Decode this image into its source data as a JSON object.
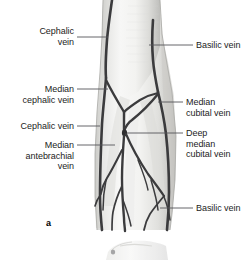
{
  "figure": {
    "letter": "a",
    "letter_x": 46,
    "letter_y": 218
  },
  "labels": [
    {
      "name": "label-cephalic-vein-upper",
      "text": "Cephalic\nvein",
      "align": "right",
      "x": 6,
      "y": 26,
      "width": 68,
      "leader": {
        "x1": 77,
        "y1": 37,
        "x2": 108,
        "y2": 37
      }
    },
    {
      "name": "label-basilic-vein-upper",
      "text": "Basilic vein",
      "align": "left",
      "x": 196,
      "y": 40,
      "width": 50,
      "leader": {
        "x1": 149,
        "y1": 45,
        "x2": 193,
        "y2": 45
      }
    },
    {
      "name": "label-median-cephalic-vein",
      "text": "Median\ncephalic vein",
      "align": "right",
      "x": 4,
      "y": 84,
      "width": 70,
      "leader": {
        "x1": 77,
        "y1": 89,
        "x2": 108,
        "y2": 89
      }
    },
    {
      "name": "label-median-cubital-vein",
      "text": "Median\ncubital vein",
      "align": "left",
      "x": 186,
      "y": 97,
      "width": 60,
      "leader": {
        "x1": 158,
        "y1": 102,
        "x2": 183,
        "y2": 102
      }
    },
    {
      "name": "label-cephalic-vein-lower",
      "text": "Cephalic vein",
      "align": "right",
      "x": 6,
      "y": 121,
      "width": 68,
      "leader": {
        "x1": 77,
        "y1": 126,
        "x2": 100,
        "y2": 126
      }
    },
    {
      "name": "label-deep-median-cubital-vein",
      "text": "Deep\nmedian\ncubital vein",
      "align": "left",
      "x": 186,
      "y": 128,
      "width": 60,
      "leader": {
        "x1": 127,
        "y1": 133,
        "x2": 183,
        "y2": 133
      }
    },
    {
      "name": "label-median-antebrachial-vein",
      "text": "Median\nantebrachial\nvein",
      "align": "right",
      "x": 4,
      "y": 140,
      "width": 70,
      "leader": {
        "x1": 77,
        "y1": 145,
        "x2": 115,
        "y2": 145
      }
    },
    {
      "name": "label-basilic-vein-lower",
      "text": "Basilic vein",
      "align": "left",
      "x": 196,
      "y": 203,
      "width": 50,
      "leader": {
        "x1": 160,
        "y1": 208,
        "x2": 193,
        "y2": 208
      }
    }
  ],
  "colors": {
    "vein": "#3b3b3d",
    "leader": "#55565a",
    "skin_light": "#f4f4f3",
    "skin_mid": "#e4e4e2",
    "skin_shadow": "#c9c9c6",
    "text": "#1c1c1c",
    "background": "#ffffff"
  },
  "illustration": {
    "view_name": "anterior-cubital-fossa-superficial-veins",
    "arm_top_left": 103,
    "arm_top_right": 160,
    "forearm_bottom_left": 97,
    "forearm_bottom_right": 174
  }
}
